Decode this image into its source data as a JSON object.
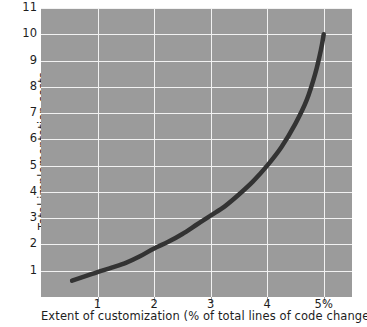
{
  "chart_data": {
    "type": "line",
    "title": "",
    "xlabel": "Extent of customization (% of total lines of code changed)",
    "ylabel": "Total implementation costs",
    "xlim": [
      0,
      5.5
    ],
    "ylim": [
      0,
      11
    ],
    "grid": true,
    "legend": null,
    "xticks": [
      {
        "value": 1,
        "label": "1"
      },
      {
        "value": 2,
        "label": "2"
      },
      {
        "value": 3,
        "label": "3"
      },
      {
        "value": 4,
        "label": "4"
      },
      {
        "value": 5,
        "label": "5%"
      }
    ],
    "yticks": [
      {
        "value": 1,
        "label": "1"
      },
      {
        "value": 2,
        "label": "2"
      },
      {
        "value": 3,
        "label": "3"
      },
      {
        "value": 4,
        "label": "4"
      },
      {
        "value": 5,
        "label": "5"
      },
      {
        "value": 6,
        "label": "6"
      },
      {
        "value": 7,
        "label": "7"
      },
      {
        "value": 8,
        "label": "8"
      },
      {
        "value": 9,
        "label": "9"
      },
      {
        "value": 10,
        "label": "10"
      },
      {
        "value": 11,
        "label": "11"
      }
    ],
    "series": [
      {
        "name": "Total implementation costs",
        "color": "#333333",
        "linewidth": 4.5,
        "x": [
          0.55,
          0.8,
          1.0,
          1.25,
          1.5,
          1.75,
          2.0,
          2.25,
          2.5,
          2.75,
          3.0,
          3.25,
          3.5,
          3.75,
          4.0,
          4.25,
          4.5,
          4.7,
          4.85,
          4.95,
          5.0
        ],
        "y": [
          0.62,
          0.8,
          0.95,
          1.12,
          1.3,
          1.55,
          1.85,
          2.1,
          2.4,
          2.75,
          3.1,
          3.45,
          3.9,
          4.4,
          5.0,
          5.7,
          6.6,
          7.5,
          8.5,
          9.4,
          10.0
        ]
      }
    ],
    "colors": {
      "plot_background": "#9b9b9b",
      "gridline": "#f2f2f2",
      "curve": "#333333",
      "text": "#1e1e1e",
      "page_background": "#ffffff"
    }
  }
}
